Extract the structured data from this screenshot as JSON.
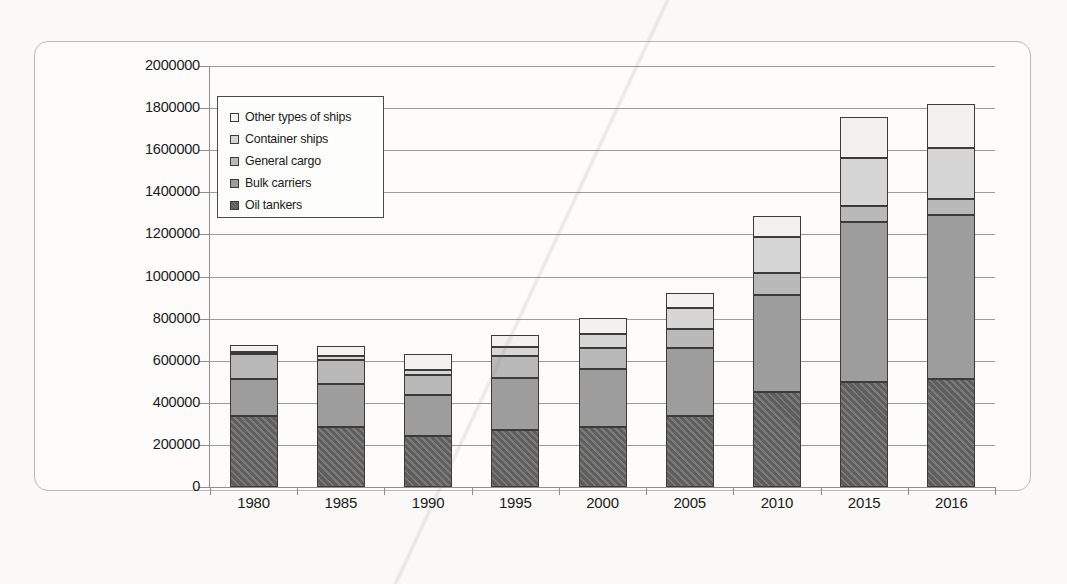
{
  "chart_data": {
    "type": "bar",
    "subtype": "stacked-column",
    "title": "",
    "xlabel": "",
    "ylabel": "",
    "ylim": [
      0,
      2000000
    ],
    "ytick_values": [
      0,
      200000,
      400000,
      600000,
      800000,
      1000000,
      1200000,
      1400000,
      1600000,
      1800000,
      2000000
    ],
    "ytick_labels": [
      "0",
      "200000",
      "400000",
      "600000",
      "800000",
      "1000000",
      "1200000",
      "1400000",
      "1600000",
      "1800000",
      "2000000"
    ],
    "grid": true,
    "grid_axis": "y",
    "legend_position": "upper-left-inside",
    "categories": [
      "1980",
      "1985",
      "1990",
      "1995",
      "2000",
      "2005",
      "2010",
      "2015",
      "2016"
    ],
    "series": [
      {
        "name": "Oil tankers",
        "color": "#5e5e5e",
        "values": [
          339000,
          283000,
          240000,
          269000,
          285000,
          339000,
          453000,
          499000,
          512000
        ]
      },
      {
        "name": "Bulk carriers",
        "color": "#9d9d9d",
        "values": [
          176000,
          208000,
          195000,
          248000,
          276000,
          320000,
          457000,
          761000,
          779000
        ]
      },
      {
        "name": "General cargo",
        "color": "#b9b9b9",
        "values": [
          116000,
          114000,
          95000,
          104000,
          101000,
          92000,
          108000,
          76000,
          75000
        ]
      },
      {
        "name": "Container ships",
        "color": "#d6d6d6",
        "values": [
          11000,
          19000,
          26000,
          44000,
          64000,
          98000,
          169000,
          228000,
          244000
        ]
      },
      {
        "name": "Other types of ships",
        "color": "#f2f1ef",
        "values": [
          31000,
          47000,
          75000,
          57000,
          76000,
          71000,
          100000,
          194000,
          208000
        ]
      }
    ],
    "totals": [
      673000,
      671000,
      631000,
      722000,
      802000,
      920000,
      1287000,
      1758000,
      1818000
    ],
    "legend_entries": [
      "Other types of ships",
      "Container ships",
      "General cargo",
      "Bulk carriers",
      "Oil tankers"
    ]
  }
}
